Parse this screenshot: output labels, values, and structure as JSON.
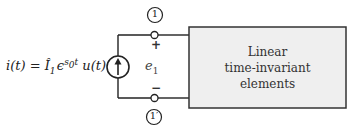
{
  "source": {
    "equation_lhs": "i(t) = ",
    "current_symbol": "Î",
    "current_sub": "1",
    "exp_base": "ϵ",
    "exp_power_s": "s",
    "exp_power_sub": "0",
    "exp_power_t": "t",
    "step": " u(t)",
    "type": "current-source-arrow-up"
  },
  "nodes": {
    "top_label": "1",
    "bottom_label": "1′"
  },
  "voltage": {
    "symbol": "e",
    "sub": "1",
    "plus": "+",
    "minus": "−"
  },
  "block": {
    "line1": "Linear",
    "line2": "time-invariant",
    "line3": "elements",
    "fill": "#efefef",
    "stroke": "#333333"
  }
}
